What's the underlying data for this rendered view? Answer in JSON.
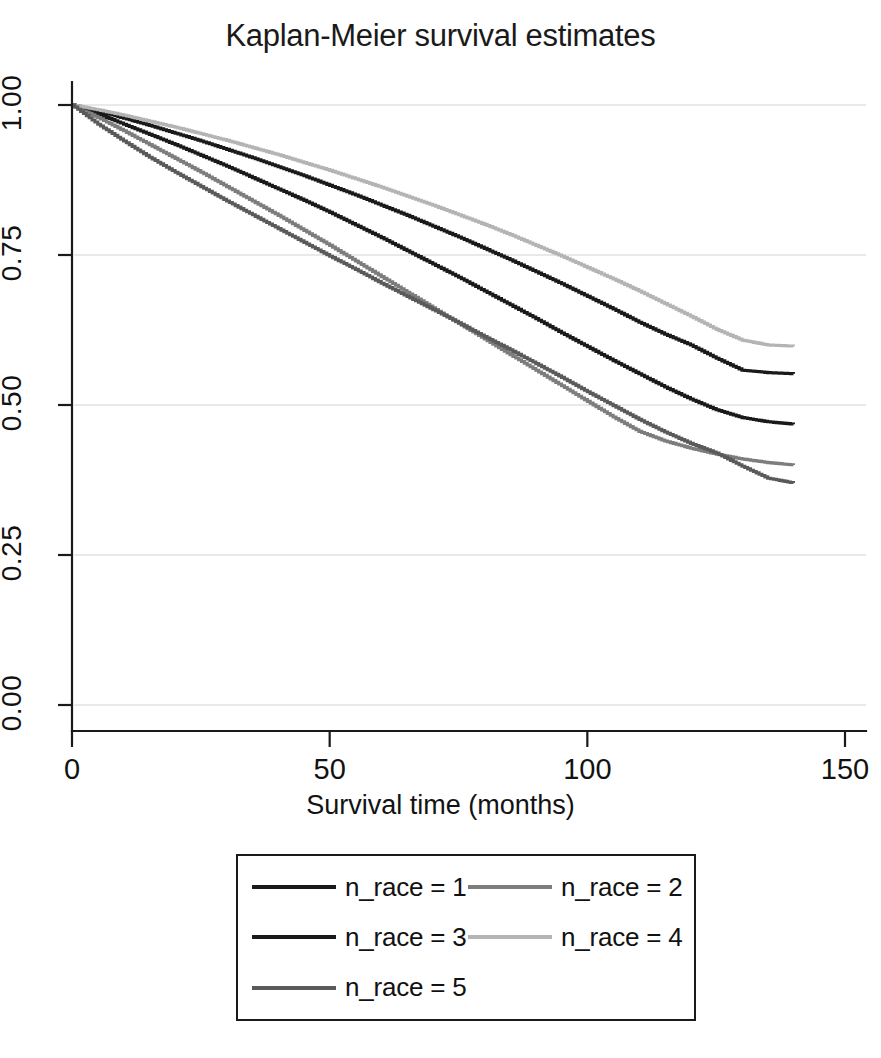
{
  "chart_data": {
    "type": "line",
    "title": "Kaplan-Meier survival estimates",
    "xlabel": "Survival time (months)",
    "ylabel": "",
    "xlim": [
      0,
      150
    ],
    "ylim": [
      0,
      1.0
    ],
    "xticks": [
      0,
      50,
      100,
      150
    ],
    "xtick_labels": [
      "0",
      "50",
      "100",
      "150"
    ],
    "yticks": [
      0.0,
      0.25,
      0.5,
      0.75,
      1.0
    ],
    "ytick_labels": [
      "0.00",
      "0.25",
      "0.50",
      "0.75",
      "1.00"
    ],
    "grid": true,
    "grid_axis": "y",
    "legend_position": "below",
    "series": [
      {
        "name": "n_race = 1",
        "color": "#1a1a1a",
        "x": [
          0,
          5,
          10,
          15,
          20,
          25,
          30,
          35,
          40,
          45,
          50,
          55,
          60,
          65,
          70,
          75,
          80,
          85,
          90,
          95,
          100,
          105,
          110,
          115,
          120,
          125,
          130,
          135,
          140
        ],
        "y": [
          1.0,
          0.985,
          0.968,
          0.951,
          0.934,
          0.916,
          0.898,
          0.879,
          0.86,
          0.841,
          0.821,
          0.8,
          0.779,
          0.757,
          0.735,
          0.713,
          0.69,
          0.667,
          0.644,
          0.62,
          0.597,
          0.574,
          0.552,
          0.53,
          0.51,
          0.492,
          0.479,
          0.472,
          0.468
        ]
      },
      {
        "name": "n_race = 2",
        "color": "#7d7d7d",
        "x": [
          0,
          5,
          10,
          15,
          20,
          25,
          30,
          35,
          40,
          45,
          50,
          55,
          60,
          65,
          70,
          75,
          80,
          85,
          90,
          95,
          100,
          105,
          110,
          115,
          120,
          125,
          130,
          135,
          140
        ],
        "y": [
          1.0,
          0.979,
          0.957,
          0.934,
          0.911,
          0.888,
          0.864,
          0.84,
          0.816,
          0.791,
          0.766,
          0.74,
          0.714,
          0.688,
          0.662,
          0.636,
          0.61,
          0.584,
          0.558,
          0.532,
          0.506,
          0.48,
          0.456,
          0.44,
          0.428,
          0.418,
          0.41,
          0.404,
          0.4
        ]
      },
      {
        "name": "n_race = 3",
        "color": "#1a1a1a",
        "x": [
          0,
          5,
          10,
          15,
          20,
          25,
          30,
          35,
          40,
          45,
          50,
          55,
          60,
          65,
          70,
          75,
          80,
          85,
          90,
          95,
          100,
          105,
          110,
          115,
          120,
          125,
          130,
          135,
          140
        ],
        "y": [
          1.0,
          0.99,
          0.978,
          0.966,
          0.953,
          0.94,
          0.926,
          0.912,
          0.897,
          0.882,
          0.866,
          0.85,
          0.833,
          0.816,
          0.798,
          0.78,
          0.761,
          0.742,
          0.722,
          0.702,
          0.681,
          0.66,
          0.638,
          0.618,
          0.6,
          0.578,
          0.558,
          0.554,
          0.552
        ]
      },
      {
        "name": "n_race = 4",
        "color": "#b4b4b4",
        "x": [
          0,
          5,
          10,
          15,
          20,
          25,
          30,
          35,
          40,
          45,
          50,
          55,
          60,
          65,
          70,
          75,
          80,
          85,
          90,
          95,
          100,
          105,
          110,
          115,
          120,
          125,
          130,
          135,
          140
        ],
        "y": [
          1.0,
          0.992,
          0.983,
          0.973,
          0.963,
          0.952,
          0.941,
          0.929,
          0.917,
          0.904,
          0.891,
          0.877,
          0.863,
          0.848,
          0.833,
          0.817,
          0.801,
          0.784,
          0.766,
          0.748,
          0.729,
          0.71,
          0.69,
          0.669,
          0.648,
          0.626,
          0.608,
          0.6,
          0.598
        ]
      },
      {
        "name": "n_race = 5",
        "color": "#5a5a5a",
        "x": [
          0,
          5,
          10,
          15,
          20,
          25,
          30,
          35,
          40,
          45,
          50,
          55,
          60,
          65,
          70,
          75,
          80,
          85,
          90,
          95,
          100,
          105,
          110,
          115,
          120,
          125,
          130,
          135,
          140
        ],
        "y": [
          1.0,
          0.968,
          0.94,
          0.913,
          0.888,
          0.864,
          0.84,
          0.817,
          0.794,
          0.771,
          0.748,
          0.726,
          0.703,
          0.681,
          0.659,
          0.637,
          0.614,
          0.592,
          0.569,
          0.546,
          0.522,
          0.499,
          0.476,
          0.455,
          0.436,
          0.42,
          0.398,
          0.378,
          0.37
        ]
      }
    ]
  },
  "legend": {
    "entries": [
      {
        "label": "n_race = 1",
        "color": "#1a1a1a"
      },
      {
        "label": "n_race = 2",
        "color": "#7d7d7d"
      },
      {
        "label": "n_race = 3",
        "color": "#1a1a1a"
      },
      {
        "label": "n_race = 4",
        "color": "#b4b4b4"
      },
      {
        "label": "n_race = 5",
        "color": "#5a5a5a"
      }
    ]
  },
  "colors": {
    "axis": "#1a1a1a",
    "grid": "#e2e2e2",
    "background": "#ffffff",
    "text": "#121212"
  }
}
